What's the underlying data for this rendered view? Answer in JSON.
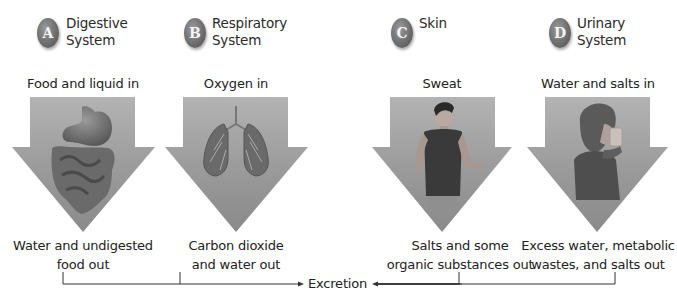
{
  "colors": {
    "arrow_fill_top": "#a8a8a8",
    "arrow_fill_bottom": "#8a8a8a",
    "badge": "#6e6e6e",
    "line": "#333333"
  },
  "systems": [
    {
      "letter": "A",
      "name_line1": "Digestive",
      "name_line2": "System",
      "input": "Food and liquid in",
      "illustration": "stomach-intestines-icon",
      "output_line1": "Water and undigested",
      "output_line2": "food out"
    },
    {
      "letter": "B",
      "name_line1": "Respiratory",
      "name_line2": "System",
      "input": "Oxygen in",
      "illustration": "lungs-icon",
      "output_line1": "Carbon dioxide",
      "output_line2": "and water out"
    },
    {
      "letter": "C",
      "name_line1": "Skin",
      "name_line2": "",
      "input": "Sweat",
      "illustration": "man-in-tank-top-icon",
      "output_line1": "Salts and some",
      "output_line2": "organic substances out"
    },
    {
      "letter": "D",
      "name_line1": "Urinary",
      "name_line2": "System",
      "input": "Water and salts in",
      "illustration": "woman-drinking-icon",
      "output_line1": "Excess water, metabolic",
      "output_line2": "wastes, and salts out"
    }
  ],
  "result": {
    "label": "Excretion"
  }
}
